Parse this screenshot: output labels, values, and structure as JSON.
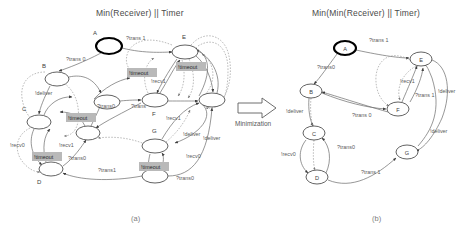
{
  "figure": {
    "caption_a": "(a)",
    "caption_b": "(b)",
    "minimization_label": "Minimization"
  },
  "left_diagram": {
    "title": "Min(Receiver) || Timer",
    "nodes": [
      {
        "id": "A",
        "label": "A",
        "initial": true,
        "x": 109,
        "y": 46,
        "rx": 13,
        "ry": 8
      },
      {
        "id": "B",
        "label": "B",
        "initial": false,
        "x": 57,
        "y": 79,
        "rx": 12,
        "ry": 7
      },
      {
        "id": "C",
        "label": "C",
        "initial": false,
        "x": 39,
        "y": 122,
        "rx": 12,
        "ry": 7
      },
      {
        "id": "D",
        "label": "D",
        "initial": false,
        "x": 51,
        "y": 169,
        "rx": 12,
        "ry": 7
      },
      {
        "id": "E",
        "label": "E",
        "initial": false,
        "x": 185,
        "y": 52,
        "rx": 13,
        "ry": 7
      },
      {
        "id": "F",
        "label": "F",
        "initial": false,
        "x": 155,
        "y": 100,
        "rx": 13,
        "ry": 7
      },
      {
        "id": "G",
        "label": "G",
        "initial": false,
        "x": 155,
        "y": 146,
        "rx": 13,
        "ry": 7
      },
      {
        "id": "H",
        "label": "",
        "initial": false,
        "x": 212,
        "y": 100,
        "rx": 13,
        "ry": 7
      },
      {
        "id": "I",
        "label": "",
        "initial": false,
        "x": 88,
        "y": 133,
        "rx": 12,
        "ry": 7
      },
      {
        "id": "J",
        "label": "",
        "initial": false,
        "x": 107,
        "y": 102,
        "rx": 13,
        "ry": 7
      },
      {
        "id": "K",
        "label": "",
        "initial": false,
        "x": 155,
        "y": 176,
        "rx": 13,
        "ry": 7
      }
    ],
    "edge_labels": [
      {
        "text": "?trans 1",
        "x": 126,
        "y": 40
      },
      {
        "text": "?trans 0",
        "x": 66,
        "y": 61
      },
      {
        "text": "!deliver",
        "x": 35,
        "y": 95
      },
      {
        "text": "!recv0",
        "x": 10,
        "y": 147
      },
      {
        "text": "!recv1",
        "x": 59,
        "y": 147
      },
      {
        "text": "?trans0",
        "x": 68,
        "y": 160
      },
      {
        "text": "?trans0",
        "x": 97,
        "y": 108
      },
      {
        "text": "?trans",
        "x": 131,
        "y": 108
      },
      {
        "text": "!recv1",
        "x": 151,
        "y": 83
      },
      {
        "text": "!deliver",
        "x": 183,
        "y": 136
      },
      {
        "text": "!recv1",
        "x": 166,
        "y": 120
      },
      {
        "text": "!recv0",
        "x": 186,
        "y": 158
      },
      {
        "text": "!deliver",
        "x": 203,
        "y": 140
      },
      {
        "text": "?trans1",
        "x": 98,
        "y": 172
      },
      {
        "text": "?trans0",
        "x": 176,
        "y": 180
      }
    ],
    "highlight_labels": [
      {
        "text": "!timeout",
        "x": 129,
        "y": 74
      },
      {
        "text": "!timeout",
        "x": 178,
        "y": 68
      },
      {
        "text": "!timeout",
        "x": 68,
        "y": 119
      },
      {
        "text": "!timeout",
        "x": 34,
        "y": 158
      },
      {
        "text": "!timeout",
        "x": 141,
        "y": 168
      }
    ]
  },
  "right_diagram": {
    "title": "Min(Min(Receiver) || Timer)",
    "nodes": [
      {
        "id": "A",
        "label": "A",
        "initial": true,
        "x": 345,
        "y": 48,
        "rx": 11,
        "ry": 7
      },
      {
        "id": "B",
        "label": "B",
        "initial": false,
        "x": 311,
        "y": 91,
        "rx": 11,
        "ry": 7
      },
      {
        "id": "C",
        "label": "C",
        "initial": false,
        "x": 314,
        "y": 133,
        "rx": 11,
        "ry": 7
      },
      {
        "id": "D",
        "label": "D",
        "initial": false,
        "x": 317,
        "y": 177,
        "rx": 11,
        "ry": 7
      },
      {
        "id": "E",
        "label": "E",
        "initial": false,
        "x": 421,
        "y": 59,
        "rx": 11,
        "ry": 7
      },
      {
        "id": "F",
        "label": "F",
        "initial": false,
        "x": 398,
        "y": 109,
        "rx": 11,
        "ry": 7
      },
      {
        "id": "G",
        "label": "G",
        "initial": false,
        "x": 407,
        "y": 152,
        "rx": 11,
        "ry": 7
      }
    ],
    "edge_labels": [
      {
        "text": "?trans 1",
        "x": 369,
        "y": 42
      },
      {
        "text": "?trans0",
        "x": 317,
        "y": 69
      },
      {
        "text": "!deliver",
        "x": 288,
        "y": 113
      },
      {
        "text": "!recv1",
        "x": 400,
        "y": 83
      },
      {
        "text": "?trans 1",
        "x": 415,
        "y": 97
      },
      {
        "text": "?trans 0",
        "x": 355,
        "y": 117
      },
      {
        "text": "!recv0",
        "x": 283,
        "y": 156
      },
      {
        "text": "?trans0",
        "x": 339,
        "y": 149
      },
      {
        "text": "?trans 1",
        "x": 363,
        "y": 174
      },
      {
        "text": "!deliver",
        "x": 433,
        "y": 133
      },
      {
        "text": "!deliver",
        "x": 441,
        "y": 93
      }
    ]
  }
}
